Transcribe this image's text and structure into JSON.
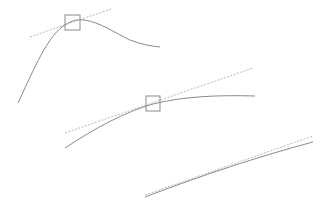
{
  "diagram": {
    "colors": {
      "background": "#ffffff",
      "curve": "#8a8a8a",
      "tangent": "#b8b8b8",
      "zoom_box": "#8a8a8a"
    },
    "panels": [
      {
        "id": "panel-1",
        "curve_path": "M18,103 C30,78 45,40 62,27 C70,21 76,19 84,20 C100,22 115,33 130,40 C140,44 150,46 160,47",
        "tangent": {
          "x1": 30,
          "y1": 37,
          "x2": 111,
          "y2": 9
        },
        "zoom_box": {
          "x": 65,
          "y": 15,
          "w": 15,
          "h": 15
        }
      },
      {
        "id": "panel-2",
        "curve_path": "M65,148 C95,128 125,112 153,104 C185,96 220,95 255,96",
        "tangent": {
          "x1": 65,
          "y1": 133,
          "x2": 253,
          "y2": 68
        },
        "zoom_box": {
          "x": 146,
          "y": 96,
          "w": 14,
          "h": 15
        }
      },
      {
        "id": "panel-3",
        "curve_path": "M145,197 C200,176 260,156 313,142",
        "tangent": {
          "x1": 145,
          "y1": 195,
          "x2": 313,
          "y2": 136
        },
        "zoom_box": null
      }
    ]
  }
}
